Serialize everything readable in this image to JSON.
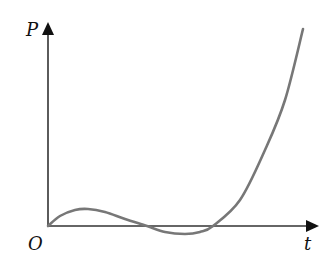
{
  "chart_data": {
    "type": "line",
    "title": "",
    "xlabel": "t",
    "ylabel": "P",
    "origin_label": "O",
    "grid": false,
    "legend": null,
    "ticks": {
      "x": [],
      "y": []
    },
    "series": [
      {
        "name": "P(t)",
        "color": "#777777",
        "shape": "cubic-like: rises from origin to small local maximum, dips below t-axis to a local minimum, then rises steeply",
        "points_px": [
          [
            48,
            226
          ],
          [
            60,
            216
          ],
          [
            75,
            210
          ],
          [
            88,
            209
          ],
          [
            105,
            212
          ],
          [
            125,
            219
          ],
          [
            147,
            226
          ],
          [
            165,
            232
          ],
          [
            185,
            234
          ],
          [
            200,
            232
          ],
          [
            213,
            226
          ],
          [
            240,
            200
          ],
          [
            265,
            150
          ],
          [
            285,
            100
          ],
          [
            303,
            29
          ]
        ]
      }
    ],
    "axes": {
      "origin_px": [
        48,
        226
      ],
      "x_axis_end_px": [
        318,
        226
      ],
      "y_axis_end_px": [
        48,
        20
      ]
    }
  },
  "labels": {
    "y_axis": "P",
    "x_axis": "t",
    "origin": "O"
  }
}
